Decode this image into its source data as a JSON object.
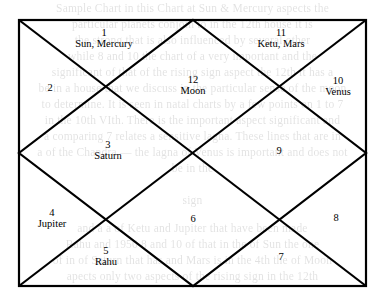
{
  "document": {
    "kind": "north-indian-vedic-birth-chart",
    "title": "Birth Chart"
  },
  "colors": {
    "ink": "#000000",
    "paper": "#ffffff",
    "bleed": "#000000"
  },
  "chart_data": {
    "type": "diagram",
    "title": "",
    "style": "north-indian-kundali",
    "house_count": 12,
    "houses": [
      {
        "number": "1",
        "planets": "Sun, Mercury",
        "x": 104,
        "y": 38,
        "empty": false
      },
      {
        "number": "2",
        "planets": "",
        "x": 50,
        "y": 88,
        "empty": true
      },
      {
        "number": "3",
        "planets": "Saturn",
        "x": 108,
        "y": 150,
        "empty": false
      },
      {
        "number": "4",
        "planets": "Jupiter",
        "x": 52,
        "y": 218,
        "empty": false
      },
      {
        "number": "5",
        "planets": "Rahu",
        "x": 106,
        "y": 256,
        "empty": false
      },
      {
        "number": "6",
        "planets": "",
        "x": 193,
        "y": 219,
        "empty": true
      },
      {
        "number": "7",
        "planets": "",
        "x": 281,
        "y": 257,
        "empty": true
      },
      {
        "number": "8",
        "planets": "",
        "x": 336,
        "y": 218,
        "empty": true
      },
      {
        "number": "9",
        "planets": "",
        "x": 279,
        "y": 151,
        "empty": true
      },
      {
        "number": "10",
        "planets": "Venus",
        "x": 338,
        "y": 86,
        "empty": false
      },
      {
        "number": "11",
        "planets": "Ketu, Mars",
        "x": 281,
        "y": 38,
        "empty": false
      },
      {
        "number": "12",
        "planets": "Moon",
        "x": 193,
        "y": 85,
        "empty": false
      }
    ],
    "geometry": {
      "outer_rect": {
        "x": 19,
        "y": 20,
        "width": 347,
        "height": 266
      },
      "vertices": {
        "top_left": [
          19,
          20
        ],
        "top_mid": [
          193,
          20
        ],
        "top_right": [
          366,
          20
        ],
        "right_mid": [
          366,
          153
        ],
        "bottom_right": [
          366,
          286
        ],
        "bottom_mid": [
          193,
          286
        ],
        "bottom_left": [
          19,
          286
        ],
        "left_mid": [
          19,
          153
        ],
        "center": [
          193,
          153
        ]
      },
      "diagonals": [
        "top_left -> bottom_right",
        "top_right -> bottom_left"
      ],
      "inner_diamond": [
        "top_mid -> right_mid",
        "right_mid -> bottom_mid",
        "bottom_mid -> left_mid",
        "left_mid -> top_mid"
      ]
    }
  },
  "bleed_text": {
    "lines": [
      {
        "text": "Sample Chart in this Chart at Sun & Mercury aspects the",
        "top": 2
      },
      {
        "text": "particular planets conjoin to in the 12th house it is",
        "top": 18
      },
      {
        "text": "the strong that is also influenced by several other",
        "top": 34
      },
      {
        "text": "while 8 and 10 the chart of a very important and the",
        "top": 50
      },
      {
        "text": "significant of that of the rising sign aspect the 12th it has a",
        "top": 66
      },
      {
        "text": "be in a house that we discuss in the particular sense of the moon",
        "top": 82
      },
      {
        "text": "to determine. It is seen in natal charts by a few points on 1 to 7",
        "top": 98
      },
      {
        "text": "in the 10th VIth. There is the important aspect significant and",
        "top": 114
      },
      {
        "text": "a comparing 7 relates a sensitive lagna. These lines that are in",
        "top": 130
      },
      {
        "text": "a of the Chandra — the lagna of Venus is important and does not",
        "top": 146
      },
      {
        "text": "be in the",
        "top": 162
      },
      {
        "text": "",
        "top": 178
      },
      {
        "text": "sign",
        "top": 194
      },
      {
        "text": "",
        "top": 206
      },
      {
        "text": "and a a of Ketu and Jupiter that have been made",
        "top": 222
      },
      {
        "text": "Rahu and 1950 8 and 10 of that in the of Sun the one",
        "top": 238
      },
      {
        "text": "of in of Saturn that has and Mars is in the 4th the of Moon",
        "top": 254
      },
      {
        "text": "apects only two aspects of the rising sign in the 12th",
        "top": 270
      }
    ]
  }
}
